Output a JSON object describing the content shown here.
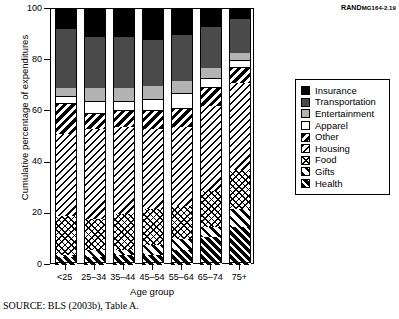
{
  "figure_id": {
    "prefix": "RAND",
    "code": "MG164-2.19"
  },
  "source_note": "SOURCE: BLS (2003b), Table A.",
  "axes": {
    "ylabel": "Cumulative percentage of expenditures",
    "xlabel": "Age group",
    "yticks": [
      0,
      20,
      40,
      60,
      80,
      100
    ],
    "ylim": [
      0,
      100
    ]
  },
  "legend": {
    "position": "right",
    "items": [
      {
        "label": "Insurance",
        "key": "insurance",
        "color": "#000000",
        "pattern": "solid-black"
      },
      {
        "label": "Transportation",
        "key": "transportation",
        "color": "#4a4a4a",
        "pattern": "solid-dark-gray"
      },
      {
        "label": "Entertainment",
        "key": "entertainment",
        "color": "#b3b3b3",
        "pattern": "solid-light-gray"
      },
      {
        "label": "Apparel",
        "key": "apparel",
        "color": "#ffffff",
        "pattern": "solid-white"
      },
      {
        "label": "Other",
        "key": "other",
        "color": "#000000",
        "pattern": "thick-diagonal"
      },
      {
        "label": "Housing",
        "key": "housing",
        "color": "#000000",
        "pattern": "diagonal-hatch"
      },
      {
        "label": "Food",
        "key": "food",
        "color": "#000000",
        "pattern": "cross-hatch"
      },
      {
        "label": "Gifts",
        "key": "gifts",
        "color": "#000000",
        "pattern": "back-diagonal"
      },
      {
        "label": "Health",
        "key": "health",
        "color": "#000000",
        "pattern": "bold-hatch"
      }
    ]
  },
  "chart_data": {
    "type": "bar",
    "stacked": true,
    "title": "",
    "xlabel": "Age group",
    "ylabel": "Cumulative percentage of expenditures",
    "ylim": [
      0,
      100
    ],
    "yticks": [
      0,
      20,
      40,
      60,
      80,
      100
    ],
    "grid": false,
    "legend_position": "right",
    "categories": [
      "<25",
      "25–34",
      "35–44",
      "45–54",
      "55–64",
      "65–74",
      "75+"
    ],
    "series": [
      {
        "name": "Health",
        "values": [
          3,
          3,
          4,
          4,
          6,
          11,
          15
        ]
      },
      {
        "name": "Gifts",
        "values": [
          1,
          3,
          2,
          4,
          4,
          4,
          7
        ]
      },
      {
        "name": "Food",
        "values": [
          15,
          12,
          14,
          14,
          13,
          14,
          15
        ]
      },
      {
        "name": "Housing",
        "values": [
          32,
          35,
          34,
          31,
          31,
          33,
          34
        ]
      },
      {
        "name": "Other",
        "values": [
          12,
          6,
          6,
          7,
          7,
          7,
          6
        ]
      },
      {
        "name": "Apparel",
        "values": [
          3,
          5,
          4,
          5,
          6,
          4,
          3
        ]
      },
      {
        "name": "Entertainment",
        "values": [
          3,
          5,
          5,
          5,
          5,
          4,
          3
        ]
      },
      {
        "name": "Transportation",
        "values": [
          23,
          20,
          20,
          18,
          18,
          16,
          13
        ]
      },
      {
        "name": "Insurance",
        "values": [
          8,
          11,
          11,
          12,
          10,
          7,
          4
        ]
      }
    ],
    "cumulative_tops": {
      "<25": {
        "Health": 3,
        "Gifts": 4,
        "Food": 19,
        "Housing": 51,
        "Other": 63,
        "Apparel": 66,
        "Entertainment": 69,
        "Transportation": 92,
        "Insurance": 100
      },
      "25–34": {
        "Health": 3,
        "Gifts": 6,
        "Food": 18,
        "Housing": 53,
        "Other": 59,
        "Apparel": 64,
        "Entertainment": 69,
        "Transportation": 89,
        "Insurance": 100
      },
      "35–44": {
        "Health": 4,
        "Gifts": 6,
        "Food": 20,
        "Housing": 54,
        "Other": 60,
        "Apparel": 64,
        "Entertainment": 69,
        "Transportation": 89,
        "Insurance": 100
      },
      "45–54": {
        "Health": 4,
        "Gifts": 8,
        "Food": 22,
        "Housing": 53,
        "Other": 60,
        "Apparel": 65,
        "Entertainment": 70,
        "Transportation": 88,
        "Insurance": 100
      },
      "55–64": {
        "Health": 6,
        "Gifts": 10,
        "Food": 23,
        "Housing": 54,
        "Other": 61,
        "Apparel": 67,
        "Entertainment": 72,
        "Transportation": 90,
        "Insurance": 100
      },
      "65–74": {
        "Health": 11,
        "Gifts": 15,
        "Food": 29,
        "Housing": 62,
        "Other": 69,
        "Apparel": 73,
        "Entertainment": 77,
        "Transportation": 93,
        "Insurance": 100
      },
      "75+": {
        "Health": 15,
        "Gifts": 22,
        "Food": 37,
        "Housing": 71,
        "Other": 77,
        "Apparel": 80,
        "Entertainment": 83,
        "Transportation": 96,
        "Insurance": 100
      }
    }
  }
}
